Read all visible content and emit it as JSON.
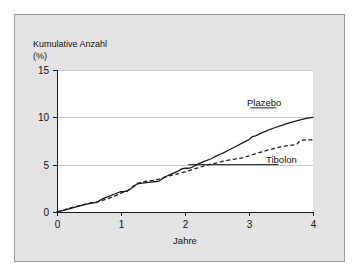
{
  "figure": {
    "background_color": "#e3e3e3",
    "plot_background_color": "#ffffff",
    "border_color": "#9a9a9a",
    "line_color": "#1b1b1b",
    "grid_color": "#c9c9c9"
  },
  "labels": {
    "y_axis_title_line1": "Kumulative Anzahl",
    "y_axis_title_line2": "(%)",
    "x_axis_title": "Jahre",
    "series_placebo": "Plazebo",
    "series_tibolon": "Tibolon"
  },
  "chart_data": {
    "type": "line",
    "title": "",
    "subtitle": "",
    "xlabel": "Jahre",
    "ylabel": "Kumulative Anzahl (%)",
    "xlim": [
      0,
      4
    ],
    "ylim": [
      0,
      15
    ],
    "xticks": [
      0,
      1,
      2,
      3,
      4
    ],
    "xtick_labels": [
      "0",
      "1",
      "2",
      "3",
      "4"
    ],
    "yticks": [
      0,
      5,
      10,
      15
    ],
    "ytick_labels": [
      "0",
      "5",
      "10",
      "15"
    ],
    "grid": "horizontal",
    "legend_position": "inline-right-annotations",
    "series": [
      {
        "name": "Plazebo",
        "style": "solid",
        "color": "#1b1b1b",
        "label_position": {
          "x": 3.55,
          "y": 11.4
        },
        "x": [
          0.0,
          0.1,
          0.2,
          0.3,
          0.4,
          0.5,
          0.55,
          0.6,
          0.62,
          0.7,
          0.8,
          0.9,
          1.0,
          1.05,
          1.1,
          1.2,
          1.25,
          1.3,
          1.4,
          1.5,
          1.55,
          1.6,
          1.7,
          1.8,
          1.9,
          1.95,
          2.0,
          2.05,
          2.1,
          2.2,
          2.3,
          2.4,
          2.5,
          2.55,
          2.6,
          2.7,
          2.8,
          2.9,
          3.0,
          3.05,
          3.1,
          3.2,
          3.3,
          3.4,
          3.5,
          3.6,
          3.7,
          3.8,
          3.9,
          4.0
        ],
        "y": [
          0.0,
          0.18,
          0.36,
          0.54,
          0.72,
          0.88,
          0.95,
          1.0,
          1.02,
          1.35,
          1.62,
          1.9,
          2.15,
          2.18,
          2.22,
          2.7,
          2.95,
          3.02,
          3.1,
          3.18,
          3.22,
          3.3,
          3.75,
          4.05,
          4.35,
          4.55,
          4.62,
          4.62,
          4.7,
          5.05,
          5.35,
          5.6,
          5.95,
          6.1,
          6.25,
          6.6,
          6.95,
          7.3,
          7.65,
          7.95,
          8.05,
          8.35,
          8.65,
          8.9,
          9.12,
          9.35,
          9.55,
          9.72,
          9.88,
          10.0
        ]
      },
      {
        "name": "Tibolon",
        "style": "dashed",
        "color": "#1b1b1b",
        "label_position": {
          "x": 3.55,
          "y": 5.15
        },
        "x": [
          0.0,
          0.1,
          0.2,
          0.3,
          0.4,
          0.5,
          0.55,
          0.6,
          0.7,
          0.8,
          0.9,
          1.0,
          1.05,
          1.1,
          1.2,
          1.25,
          1.3,
          1.4,
          1.5,
          1.55,
          1.6,
          1.7,
          1.8,
          1.9,
          2.0,
          2.1,
          2.2,
          2.3,
          2.4,
          2.5,
          2.6,
          2.7,
          2.8,
          2.9,
          3.0,
          3.1,
          3.2,
          3.3,
          3.4,
          3.5,
          3.6,
          3.7,
          3.75,
          3.8,
          3.85,
          3.9,
          4.0
        ],
        "y": [
          0.0,
          0.2,
          0.4,
          0.58,
          0.76,
          0.92,
          1.0,
          1.02,
          1.2,
          1.42,
          1.68,
          2.0,
          2.1,
          2.22,
          2.78,
          3.02,
          3.1,
          3.25,
          3.35,
          3.42,
          3.48,
          3.72,
          3.9,
          4.05,
          4.25,
          4.45,
          4.65,
          4.88,
          5.05,
          5.2,
          5.38,
          5.5,
          5.62,
          5.72,
          5.92,
          6.15,
          6.35,
          6.55,
          6.72,
          6.88,
          7.0,
          7.1,
          7.18,
          7.55,
          7.6,
          7.62,
          7.62
        ]
      }
    ]
  }
}
